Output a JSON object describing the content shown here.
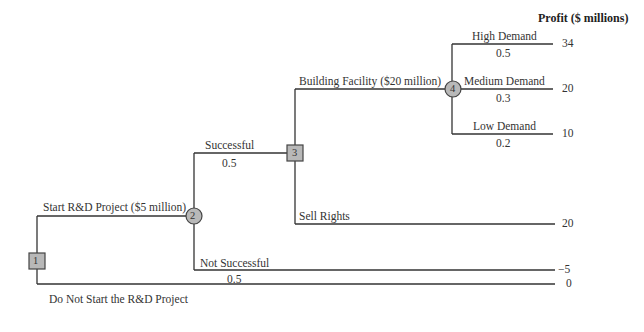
{
  "header": {
    "profit_label": "Profit ($ millions)"
  },
  "nodes": {
    "n1": "1",
    "n2": "2",
    "n3": "3",
    "n4": "4"
  },
  "branches": {
    "start_rd": "Start R&D Project ($5 million)",
    "do_not_start": "Do Not Start the R&D Project",
    "successful": "Successful",
    "successful_prob": "0.5",
    "not_successful": "Not Successful",
    "not_successful_prob": "0.5",
    "building_facility": "Building Facility ($20 million)",
    "sell_rights": "Sell Rights",
    "high_demand": "High Demand",
    "high_demand_prob": "0.5",
    "medium_demand": "Medium Demand",
    "medium_demand_prob": "0.3",
    "low_demand": "Low Demand",
    "low_demand_prob": "0.2"
  },
  "payoffs": {
    "high": "34",
    "medium": "20",
    "low": "10",
    "sell_rights": "20",
    "not_successful": "−5",
    "do_not_start": "0"
  },
  "colors": {
    "node_fill": "#b8b8b8",
    "line": "#333333"
  }
}
